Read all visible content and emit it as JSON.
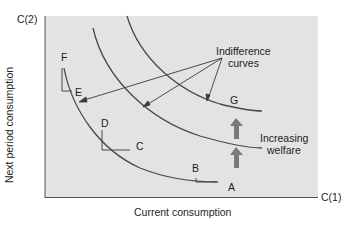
{
  "diagram": {
    "type": "indifference-curves",
    "panel_color": "#e3e3e3",
    "curve_color": "#4a4a4a",
    "arrow_color": "#7a7a7a",
    "y_axis": {
      "end_label": "C(2)",
      "title": "Next period consumption"
    },
    "x_axis": {
      "end_label": "C(1)",
      "title": "Current consumption"
    },
    "annotation": {
      "line1": "Indifference",
      "line2": "curves"
    },
    "welfare_label": {
      "line1": "Increasing",
      "line2": "welfare"
    },
    "points": {
      "A": "A",
      "B": "B",
      "C": "C",
      "D": "D",
      "E": "E",
      "F": "F",
      "G": "G"
    },
    "curves": [
      {
        "name": "curve-1",
        "points_on": [
          "F",
          "E",
          "D",
          "C",
          "B",
          "A"
        ]
      },
      {
        "name": "curve-2",
        "points_on": []
      },
      {
        "name": "curve-3",
        "points_on": [
          "G"
        ]
      }
    ]
  }
}
